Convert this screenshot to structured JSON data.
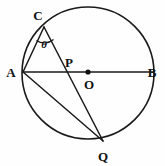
{
  "figure": {
    "kind": "circle-geometry-diagram",
    "background_color": "#fefefe",
    "stroke_color": "#1a1a1a",
    "width": 165,
    "height": 166,
    "circle": {
      "name": "main-circle",
      "center_x": 88,
      "center_y": 73,
      "radius": 66,
      "stroke_width": 1.6,
      "fill": "none"
    },
    "center_dot": {
      "name": "center-point-dot",
      "x": 88,
      "y": 72,
      "radius": 2.6,
      "color": "#111111"
    },
    "points": [
      {
        "id": "A",
        "label": "A",
        "x": 23,
        "y": 72,
        "label_x": 11,
        "label_y": 72
      },
      {
        "id": "B",
        "label": "B",
        "x": 153,
        "y": 72,
        "label_x": 152,
        "label_y": 72
      },
      {
        "id": "C",
        "label": "C",
        "x": 44,
        "y": 27,
        "label_x": 38,
        "label_y": 15
      },
      {
        "id": "P",
        "label": "P",
        "x": 66,
        "y": 72,
        "label_x": 69,
        "label_y": 62
      },
      {
        "id": "O",
        "label": "O",
        "x": 88,
        "y": 72,
        "label_x": 89,
        "label_y": 84
      },
      {
        "id": "Q",
        "label": "Q",
        "x": 103,
        "y": 141,
        "label_x": 103,
        "label_y": 156
      }
    ],
    "segments": [
      {
        "name": "segment-AB-diameter",
        "from": "A",
        "to": "B",
        "x1": 23,
        "y1": 72,
        "x2": 153,
        "y2": 72
      },
      {
        "name": "segment-CA-chord",
        "from": "C",
        "to": "A",
        "x1": 44,
        "y1": 27,
        "x2": 23,
        "y2": 72
      },
      {
        "name": "segment-CQ-chord",
        "from": "C",
        "to": "Q",
        "x1": 44,
        "y1": 27,
        "x2": 103,
        "y2": 141
      },
      {
        "name": "segment-AQ-chord",
        "from": "A",
        "to": "Q",
        "x1": 23,
        "y1": 72,
        "x2": 103,
        "y2": 141
      }
    ],
    "angle_marker": {
      "name": "angle-theta-at-C",
      "vertex": "C",
      "label": "θ",
      "label_x": 44,
      "label_y": 44,
      "arc_path": "M 36.5 40.5 A 14 14 0 0 0 53.5 39.5",
      "stroke_width": 1.3
    }
  }
}
